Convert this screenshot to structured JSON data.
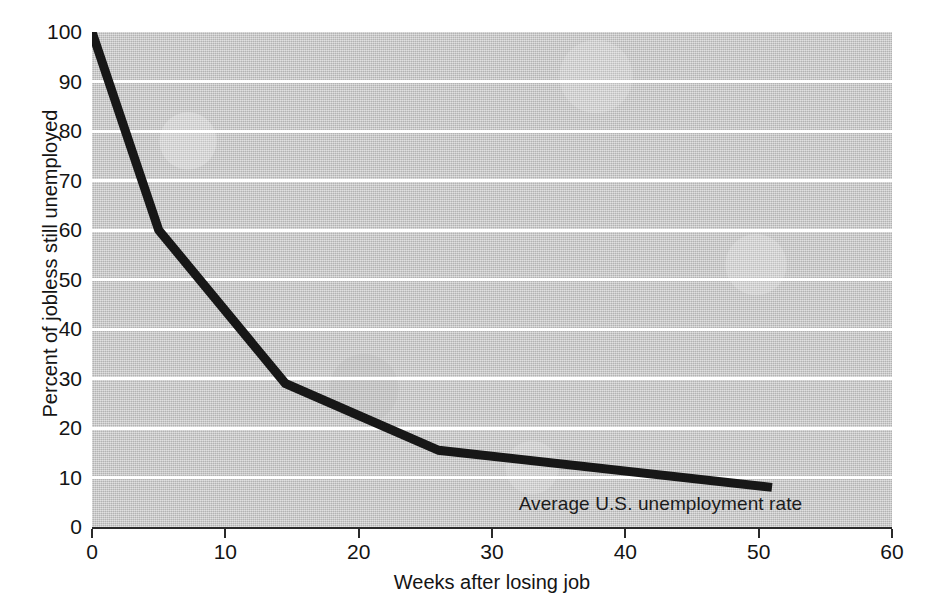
{
  "chart_data": {
    "type": "line",
    "title": "",
    "xlabel": "Weeks after losing job",
    "ylabel": "Percent of jobless still unemployed",
    "xlim": [
      0,
      60
    ],
    "ylim": [
      0,
      100
    ],
    "xticks": [
      0,
      10,
      20,
      30,
      40,
      50,
      60
    ],
    "yticks": [
      0,
      10,
      20,
      30,
      40,
      50,
      60,
      70,
      80,
      90,
      100
    ],
    "grid": "horizontal-only",
    "gridline_values": [
      10,
      20,
      30,
      40,
      50,
      60,
      70,
      80,
      90
    ],
    "legend": "none",
    "series": [
      {
        "name": "Percent of jobless still unemployed",
        "x": [
          0,
          5,
          14.5,
          26,
          51
        ],
        "values": [
          100,
          60,
          29,
          15.5,
          8
        ]
      }
    ],
    "annotations": [
      {
        "text": "Average U.S. unemployment rate",
        "x": 32,
        "y": 4.5
      }
    ],
    "colors": {
      "line": "#171717",
      "plot_background": "#c3c3c3",
      "gridline": "#ffffff",
      "axis": "#2a2a2a",
      "text": "#141414",
      "page_background": "#ffffff"
    }
  },
  "axes": {
    "x_tick_labels": [
      "0",
      "10",
      "20",
      "30",
      "40",
      "50",
      "60"
    ],
    "y_tick_labels": [
      "100",
      "90",
      "80",
      "70",
      "60",
      "50",
      "40",
      "30",
      "20",
      "10",
      "0"
    ],
    "x_title": "Weeks after losing job",
    "y_title": "Percent of jobless still unemployed"
  },
  "annotation": {
    "average_rate_label": "Average U.S. unemployment rate"
  }
}
